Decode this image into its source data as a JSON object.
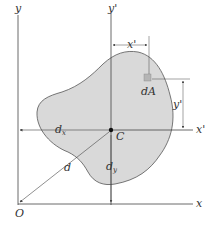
{
  "diagram": {
    "labels": {
      "y_axis": "y",
      "x_axis": "x",
      "y_prime_axis": "y'",
      "x_prime_axis": "x'",
      "origin": "O",
      "centroid": "C",
      "area_element": "dA",
      "x_prime_dim": "x'",
      "y_prime_dim": "y'",
      "dx_main": "d",
      "dx_sub": "x",
      "dy_main": "d",
      "dy_sub": "y",
      "distance": "d"
    },
    "colors": {
      "area_fill": "#d9d9d9",
      "outline": "#555555",
      "axis": "#444444",
      "text": "#333333"
    }
  }
}
